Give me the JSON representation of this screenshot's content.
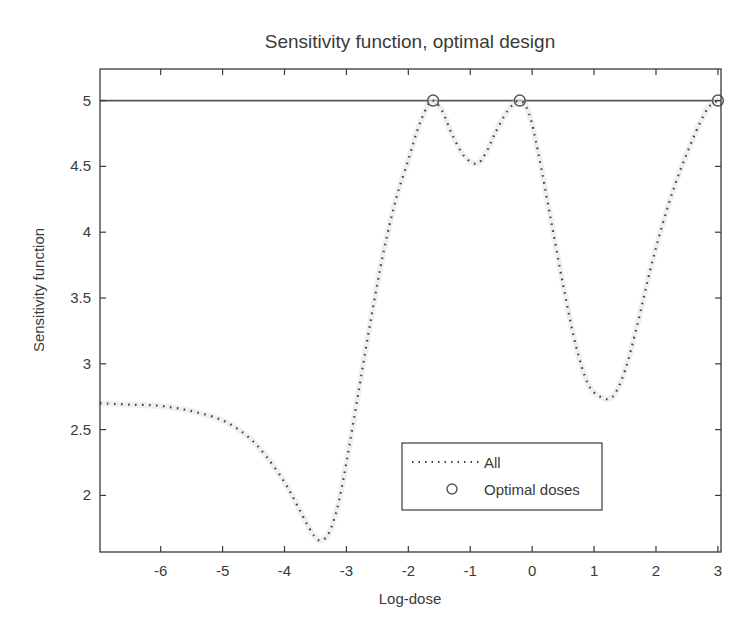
{
  "chart_data": {
    "type": "line",
    "title": "Sensitivity function,  optimal design",
    "xlabel": "Log-dose",
    "ylabel": "Sensitivity  function",
    "xlim": [
      -6.98,
      3.05
    ],
    "ylim": [
      1.57,
      5.24
    ],
    "xticks": [
      -6,
      -5,
      -4,
      -3,
      -2,
      -1,
      0,
      1,
      2,
      3
    ],
    "xtick_labels": [
      "-6",
      "-5",
      "-4",
      "-3",
      "-2",
      "-1",
      "0",
      "1",
      "2",
      "3"
    ],
    "yticks": [
      2,
      2.5,
      3,
      3.5,
      4,
      4.5,
      5
    ],
    "ytick_labels": [
      "2",
      "2.5",
      "3",
      "3.5",
      "4",
      "4.5",
      "5"
    ],
    "grid": false,
    "legend_position": "lower right (inside)",
    "reference_line": {
      "y": 5,
      "style": "solid"
    },
    "series": [
      {
        "name": "All",
        "style": "dotted",
        "x": [
          -6.98,
          -6.5,
          -6.0,
          -5.5,
          -5.0,
          -4.6,
          -4.3,
          -4.0,
          -3.8,
          -3.6,
          -3.45,
          -3.3,
          -3.15,
          -3.0,
          -2.8,
          -2.6,
          -2.4,
          -2.2,
          -2.0,
          -1.85,
          -1.7,
          -1.6,
          -1.45,
          -1.3,
          -1.1,
          -0.9,
          -0.75,
          -0.6,
          -0.4,
          -0.2,
          -0.05,
          0.1,
          0.3,
          0.5,
          0.7,
          0.9,
          1.1,
          1.3,
          1.5,
          1.7,
          1.9,
          2.1,
          2.3,
          2.5,
          2.7,
          2.85,
          3.0
        ],
        "y": [
          2.7,
          2.69,
          2.68,
          2.64,
          2.57,
          2.45,
          2.3,
          2.1,
          1.93,
          1.75,
          1.66,
          1.7,
          1.9,
          2.25,
          2.8,
          3.35,
          3.85,
          4.25,
          4.55,
          4.78,
          4.95,
          5.0,
          4.92,
          4.75,
          4.58,
          4.52,
          4.6,
          4.75,
          4.92,
          5.0,
          4.9,
          4.6,
          4.1,
          3.6,
          3.15,
          2.85,
          2.75,
          2.75,
          2.95,
          3.3,
          3.7,
          4.05,
          4.35,
          4.6,
          4.82,
          4.95,
          5.0
        ]
      },
      {
        "name": "Optimal doses",
        "style": "circle markers",
        "x": [
          -1.6,
          -0.2,
          3.0
        ],
        "y": [
          5.0,
          5.0,
          5.0
        ]
      }
    ]
  },
  "legend": {
    "items": [
      {
        "label": "All",
        "marker": "dotted-line"
      },
      {
        "label": "Optimal doses",
        "marker": "circle"
      }
    ]
  },
  "colors": {
    "axes": "#3a3a3a",
    "curve": "#444444",
    "marker": "#555555",
    "reference_line": "#555555",
    "background": "#ffffff"
  }
}
